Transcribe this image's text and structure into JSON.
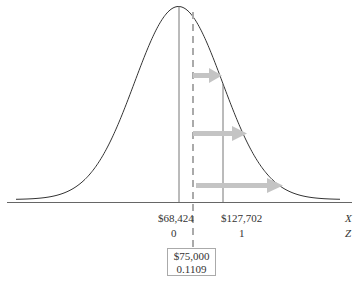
{
  "chart_data": {
    "type": "line",
    "title": "",
    "distribution": {
      "mean": 68424,
      "sigma_point": 127702,
      "std_dev": 59278
    },
    "x_axis": {
      "label": "X",
      "ticks": [
        {
          "value": 68424,
          "label": "$68,424"
        },
        {
          "value": 127702,
          "label": "$127,702"
        }
      ]
    },
    "z_axis": {
      "label": "Z",
      "ticks": [
        {
          "value": 0,
          "label": "0"
        },
        {
          "value": 1,
          "label": "1"
        }
      ]
    },
    "reference_line": {
      "x": 75000,
      "x_label": "$75,000",
      "z_label": "0.1109",
      "style": "dashed"
    },
    "arrows": 3,
    "grid": false,
    "legend": null
  },
  "labels": {
    "mean_x": "$68,424",
    "sigma_x": "$127,702",
    "axis_x": "X",
    "mean_z": "0",
    "sigma_z": "1",
    "axis_z": "Z",
    "ref_x": "$75,000",
    "ref_z": "0.1109"
  },
  "colors": {
    "curve": "#333333",
    "axis": "#666666",
    "vline": "#777777",
    "dashed": "#aaaaaa",
    "arrow": "#c4c4c4"
  }
}
